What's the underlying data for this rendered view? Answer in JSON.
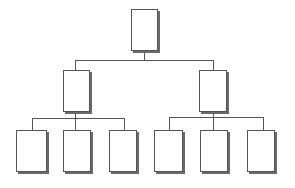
{
  "diagram": {
    "type": "org-chart",
    "levels": 3,
    "colors": {
      "line": "#555555",
      "box_border": "#555555",
      "shadow": "#6a6a6a",
      "background": "#ffffff"
    },
    "nodes": [
      {
        "id": "root",
        "label": ""
      },
      {
        "id": "mid-left",
        "label": "",
        "parent": "root"
      },
      {
        "id": "mid-right",
        "label": "",
        "parent": "root"
      },
      {
        "id": "leaf-1",
        "label": "",
        "parent": "mid-left"
      },
      {
        "id": "leaf-2",
        "label": "",
        "parent": "mid-left"
      },
      {
        "id": "leaf-3",
        "label": "",
        "parent": "mid-left"
      },
      {
        "id": "leaf-4",
        "label": "",
        "parent": "mid-right"
      },
      {
        "id": "leaf-5",
        "label": "",
        "parent": "mid-right"
      },
      {
        "id": "leaf-6",
        "label": "",
        "parent": "mid-right"
      }
    ]
  }
}
